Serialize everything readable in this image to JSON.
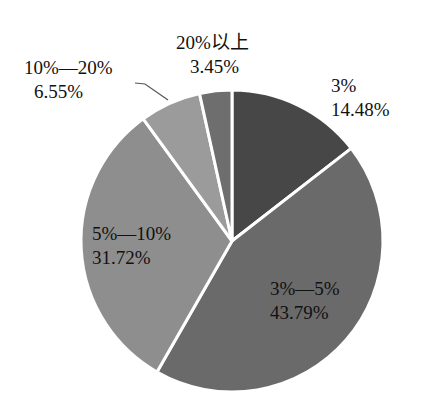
{
  "chart_data": {
    "type": "pie",
    "title": "",
    "start_angle_deg": 0,
    "direction": "clockwise",
    "center": [
      232,
      241
    ],
    "radius": 151,
    "slice_separator_color": "#ffffff",
    "slices": [
      {
        "name": "3%",
        "value": 14.48,
        "label": "14.48%",
        "color": "#474747"
      },
      {
        "name": "3%—5%",
        "value": 43.79,
        "label": "43.79%",
        "color": "#6a6a6a"
      },
      {
        "name": "5%—10%",
        "value": 31.72,
        "label": "31.72%",
        "color": "#8e8e8e"
      },
      {
        "name": "10%—20%",
        "value": 6.55,
        "label": "6.55%",
        "color": "#9b9b9b"
      },
      {
        "name": "20%以上",
        "value": 3.45,
        "label": "3.45%",
        "color": "#6e6e6e"
      }
    ],
    "legend": "none (labels placed on/near slices)",
    "leader_lines": [
      {
        "slice": "10%—20%",
        "from": [
          168,
          100
        ],
        "to": [
          135,
          83
        ]
      }
    ]
  },
  "labels": [
    {
      "id": "slice-3",
      "line1": "3%",
      "line2": "14.48%",
      "x": 331,
      "y": 74
    },
    {
      "id": "slice-3-5",
      "line1": "3%—5%",
      "line2": "43.79%",
      "x": 270,
      "y": 277
    },
    {
      "id": "slice-5-10",
      "line1": "5%—10%",
      "line2": "31.72%",
      "x": 92,
      "y": 222
    },
    {
      "id": "slice-10-20",
      "line1": "10%—20%",
      "line2": "6.55%",
      "x": 24,
      "y": 56,
      "line2_indent": 10
    },
    {
      "id": "slice-20plus",
      "line1": "20%以上",
      "line2": "3.45%",
      "x": 176,
      "y": 31,
      "line2_indent": 14
    }
  ]
}
